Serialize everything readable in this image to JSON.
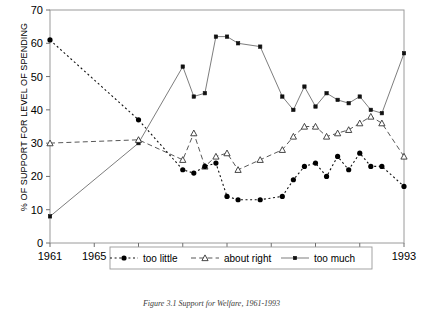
{
  "figure": {
    "caption": "Figure 3.1  Support for Welfare, 1961-1993",
    "y_axis_title": "% OF SUPPORT FOR LEVEL OF SPENDING"
  },
  "legend": {
    "items": [
      {
        "label": "too little",
        "marker": "filled-circle",
        "line": "dotted",
        "color": "#000000"
      },
      {
        "label": "about right",
        "marker": "open-triangle",
        "line": "dashed",
        "color": "#000000"
      },
      {
        "label": "too much",
        "marker": "small-square",
        "line": "solid",
        "color": "#555555"
      }
    ]
  },
  "chart_data": {
    "type": "line",
    "title": "",
    "xlabel": "",
    "ylabel": "% OF SUPPORT FOR LEVEL OF SPENDING",
    "xlim": [
      1961,
      1993
    ],
    "ylim": [
      0,
      70
    ],
    "ytick_labels": [
      "0",
      "10",
      "20",
      "30",
      "40",
      "50",
      "60",
      "70"
    ],
    "yticks": [
      0,
      10,
      20,
      30,
      40,
      50,
      60,
      70
    ],
    "xtick_labels": [
      "1961",
      "1965",
      "1969",
      "1973",
      "1977",
      "1981",
      "1985",
      "1989",
      "1993"
    ],
    "xticks": [
      1961,
      1965,
      1969,
      1973,
      1977,
      1981,
      1985,
      1989,
      1993
    ],
    "grid": false,
    "legend_position": "inside-bottom",
    "series": [
      {
        "name": "too little",
        "x": [
          1961,
          1969,
          1973,
          1974,
          1975,
          1976,
          1977,
          1978,
          1980,
          1982,
          1983,
          1984,
          1985,
          1986,
          1987,
          1988,
          1989,
          1990,
          1991,
          1993
        ],
        "values": [
          61,
          37,
          22,
          21,
          23,
          24,
          14,
          13,
          13,
          14,
          19,
          23,
          24,
          20,
          26,
          22,
          27,
          23,
          23,
          17
        ]
      },
      {
        "name": "about right",
        "x": [
          1961,
          1969,
          1973,
          1974,
          1975,
          1976,
          1977,
          1978,
          1980,
          1982,
          1983,
          1984,
          1985,
          1986,
          1987,
          1988,
          1989,
          1990,
          1991,
          1993
        ],
        "values": [
          30,
          31,
          25,
          33,
          23,
          26,
          27,
          22,
          25,
          28,
          32,
          35,
          35,
          32,
          33,
          34,
          36,
          38,
          36,
          26
        ]
      },
      {
        "name": "too much",
        "x": [
          1961,
          1969,
          1973,
          1974,
          1975,
          1976,
          1977,
          1978,
          1980,
          1982,
          1983,
          1984,
          1985,
          1986,
          1987,
          1988,
          1989,
          1990,
          1991,
          1993
        ],
        "values": [
          8,
          30,
          53,
          44,
          45,
          62,
          62,
          60,
          59,
          44,
          40,
          47,
          41,
          45,
          43,
          42,
          44,
          40,
          39,
          57
        ]
      }
    ]
  }
}
